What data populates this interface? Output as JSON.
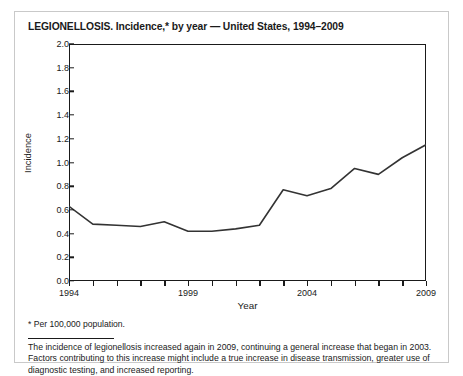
{
  "figure": {
    "title": "LEGIONELLOSIS. Incidence,* by year — United States, 1994–2009",
    "footnote": "* Per 100,000 population.",
    "note": "The incidence of legionellosis increased again in 2009, continuing a general increase that began in 2003. Factors contributing to this increase might include a true increase in disease transmission, greater use of diagnostic testing, and increased reporting."
  },
  "chart_data": {
    "type": "line",
    "title": "LEGIONELLOSIS. Incidence,* by year — United States, 1994–2009",
    "xlabel": "Year",
    "ylabel": "Incidence",
    "xlim": [
      1994,
      2009
    ],
    "ylim": [
      0.0,
      2.0
    ],
    "grid": false,
    "legend": null,
    "x": [
      1994,
      1995,
      1996,
      1997,
      1998,
      1999,
      2000,
      2001,
      2002,
      2003,
      2004,
      2005,
      2006,
      2007,
      2008,
      2009
    ],
    "values": [
      0.63,
      0.48,
      0.47,
      0.46,
      0.5,
      0.42,
      0.42,
      0.44,
      0.47,
      0.77,
      0.72,
      0.78,
      0.95,
      0.9,
      1.04,
      1.15
    ],
    "series": [
      {
        "name": "Incidence per 100,000 population",
        "color": "#333333",
        "values": [
          0.63,
          0.48,
          0.47,
          0.46,
          0.5,
          0.42,
          0.42,
          0.44,
          0.47,
          0.77,
          0.72,
          0.78,
          0.95,
          0.9,
          1.04,
          1.15
        ]
      }
    ],
    "y_ticks": [
      0.0,
      0.2,
      0.4,
      0.6,
      0.8,
      1.0,
      1.2,
      1.4,
      1.6,
      1.8,
      2.0
    ],
    "y_tick_labels": [
      "0.0",
      "0.2",
      "0.4",
      "0.6",
      "0.8",
      "1.0",
      "1.2",
      "1.4",
      "1.6",
      "1.8",
      "2.0"
    ],
    "x_ticks": [
      1994,
      1995,
      1996,
      1997,
      1998,
      1999,
      2000,
      2001,
      2002,
      2003,
      2004,
      2005,
      2006,
      2007,
      2008,
      2009
    ],
    "x_tick_labels_shown": [
      "1994",
      "1999",
      "2004",
      "2009"
    ],
    "x_labeled_years": [
      1994,
      1999,
      2004,
      2009
    ]
  }
}
